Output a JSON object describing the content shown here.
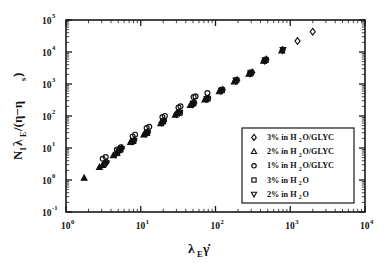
{
  "chart_data": {
    "type": "scatter",
    "title": "",
    "xlabel": "λ_E γ̇",
    "ylabel": "N₁λ_E/(η−η_s)",
    "xscale": "log",
    "yscale": "log",
    "xlim": [
      1,
      10000
    ],
    "ylim": [
      0.1,
      100000
    ],
    "grid": false,
    "legend_position": "lower-right-inside",
    "x_tick_labels": [
      "10⁰",
      "10¹",
      "10²",
      "10³",
      "10⁴"
    ],
    "x_tick_values": [
      1,
      10,
      100,
      1000,
      10000
    ],
    "y_tick_labels": [
      "10⁻¹",
      "10⁰",
      "10¹",
      "10²",
      "10³",
      "10⁴",
      "10⁵"
    ],
    "y_tick_values": [
      0.1,
      1,
      10,
      100,
      1000,
      10000,
      100000
    ],
    "series": [
      {
        "name": "3% in H2O/GLYC",
        "label_parts": {
          "pre": "3% in H",
          "sub": "2",
          "post": "O/GLYC"
        },
        "marker": "diamond",
        "filled": false,
        "points": [
          [
            3.2,
            3.1
          ],
          [
            3.5,
            3.6
          ],
          [
            4.6,
            6.4
          ],
          [
            5.0,
            7.4
          ],
          [
            5.6,
            9.8
          ],
          [
            7.6,
            16.0
          ],
          [
            8.2,
            17.5
          ],
          [
            11.5,
            28.0
          ],
          [
            12.5,
            31.0
          ],
          [
            19.0,
            62.0
          ],
          [
            20.5,
            70.0
          ],
          [
            30.0,
            115.0
          ],
          [
            33.0,
            130.0
          ],
          [
            49.0,
            235.0
          ],
          [
            52.0,
            255.0
          ],
          [
            75.0,
            340.0
          ],
          [
            80.0,
            360.0
          ],
          [
            118.0,
            620.0
          ],
          [
            125.0,
            660.0
          ],
          [
            185.0,
            1250.0
          ],
          [
            195.0,
            1320.0
          ],
          [
            290.0,
            2150.0
          ],
          [
            310.0,
            2300.0
          ],
          [
            450.0,
            5400.0
          ],
          [
            480.0,
            5800.0
          ],
          [
            790.0,
            11500.0
          ],
          [
            1250.0,
            22000.0
          ],
          [
            2000.0,
            43000.0
          ]
        ]
      },
      {
        "name": "2% in H2O/GLYC",
        "label_parts": {
          "pre": "2% in H",
          "sub": "2",
          "post": "O/GLYC"
        },
        "marker": "triangle-up",
        "filled": true,
        "points": [
          [
            1.75,
            1.15
          ],
          [
            2.8,
            2.5
          ],
          [
            3.1,
            2.9
          ],
          [
            4.3,
            5.8
          ],
          [
            4.8,
            6.8
          ],
          [
            5.3,
            9.0
          ],
          [
            7.3,
            15.0
          ],
          [
            11.0,
            26.0
          ],
          [
            12.0,
            29.5
          ],
          [
            18.5,
            58.0
          ],
          [
            29.0,
            108.0
          ],
          [
            31.5,
            122.0
          ],
          [
            46.0,
            215.0
          ],
          [
            72.0,
            320.0
          ],
          [
            112.0,
            580.0
          ],
          [
            178.0,
            1180.0
          ],
          [
            280.0,
            2050.0
          ],
          [
            440.0,
            5200.0
          ],
          [
            770.0,
            11000.0
          ]
        ]
      },
      {
        "name": "1% in H2O/GLYC",
        "label_parts": {
          "pre": "1% in H",
          "sub": "2",
          "post": "O/GLYC"
        },
        "marker": "circle",
        "filled": false,
        "points": [
          [
            3.1,
            4.6
          ],
          [
            3.4,
            5.2
          ],
          [
            4.8,
            9.0
          ],
          [
            5.4,
            10.5
          ],
          [
            7.8,
            23.0
          ],
          [
            8.4,
            26.0
          ],
          [
            12.0,
            42.0
          ],
          [
            13.0,
            46.0
          ],
          [
            19.5,
            92.0
          ],
          [
            21.0,
            100.0
          ],
          [
            32.0,
            185.0
          ],
          [
            34.0,
            200.0
          ],
          [
            51.0,
            390.0
          ],
          [
            54.0,
            410.0
          ],
          [
            78.0,
            520.0
          ]
        ]
      },
      {
        "name": "3% in H2O",
        "label_parts": {
          "pre": "3% in H",
          "sub": "2",
          "post": "O"
        },
        "marker": "square",
        "filled": false,
        "points": [
          [
            5.2,
            8.6
          ],
          [
            8.0,
            16.5
          ],
          [
            12.2,
            30.0
          ],
          [
            20.0,
            68.0
          ],
          [
            33.5,
            128.0
          ],
          [
            51.0,
            250.0
          ],
          [
            79.0,
            350.0
          ],
          [
            122.0,
            640.0
          ],
          [
            190.0,
            1300.0
          ],
          [
            300.0,
            2250.0
          ],
          [
            470.0,
            5600.0
          ]
        ]
      },
      {
        "name": "2% in H2O",
        "label_parts": {
          "pre": "2% in H",
          "sub": "2",
          "post": "O"
        },
        "marker": "triangle-down",
        "filled": true,
        "points": [
          [
            3.45,
            3.4
          ],
          [
            5.1,
            8.0
          ],
          [
            5.5,
            9.4
          ],
          [
            8.1,
            17.0
          ],
          [
            12.3,
            30.5
          ],
          [
            20.2,
            69.0
          ],
          [
            33.2,
            127.0
          ],
          [
            50.5,
            248.0
          ],
          [
            77.0,
            345.0
          ],
          [
            120.0,
            630.0
          ],
          [
            188.0,
            1280.0
          ],
          [
            295.0,
            2200.0
          ],
          [
            460.0,
            5500.0
          ],
          [
            800.0,
            11800.0
          ]
        ]
      }
    ]
  },
  "legend": {
    "entries": [
      {
        "marker": "diamond",
        "pre": "3% in H",
        "sub": "2",
        "post": "O/GLYC"
      },
      {
        "marker": "triangle-up",
        "pre": "2% in H",
        "sub": "2",
        "post": "O/GLYC"
      },
      {
        "marker": "circle",
        "pre": "1% in H",
        "sub": "2",
        "post": "O/GLYC"
      },
      {
        "marker": "square",
        "pre": "3% in H",
        "sub": "2",
        "post": "O"
      },
      {
        "marker": "triangle-down",
        "pre": "2% in H",
        "sub": "2",
        "post": "O"
      }
    ]
  },
  "axes": {
    "x_label_main": "λ",
    "x_label_sub": "E",
    "x_label_tail": "γ̇",
    "y_label_n": "N",
    "y_label_n_sub": "1",
    "y_label_lam": "λ",
    "y_label_lam_sub": "E",
    "y_label_mid": "/(η−η",
    "y_label_s_sub": "s",
    "y_label_close": ")"
  },
  "colors": {
    "background": "#ffffff",
    "ink": "#111111",
    "frame": "#1a1a1a"
  }
}
